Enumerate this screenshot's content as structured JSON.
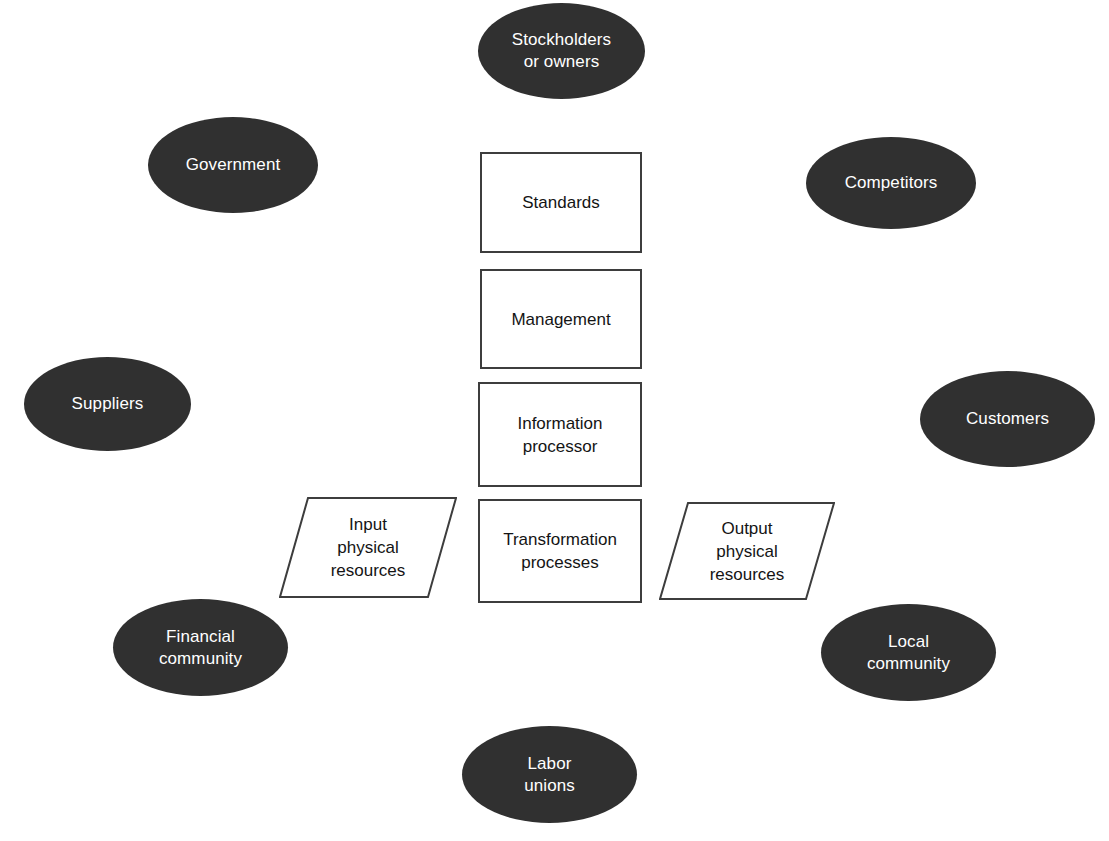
{
  "diagram": {
    "background_color": "#ffffff",
    "ellipse_fill_color": "#303030",
    "ellipse_text_color": "#ffffff",
    "box_border_color": "#3d3d3d",
    "box_fill_color": "#ffffff",
    "box_text_color": "#141414"
  },
  "environment_nodes": [
    {
      "id": "stockholders-or-owners",
      "label": "Stockholders\nor owners",
      "shape": "ellipse",
      "position": "top-center",
      "x": 478,
      "y": 3,
      "w": 167,
      "h": 96
    },
    {
      "id": "government",
      "label": "Government",
      "shape": "ellipse",
      "position": "top-left",
      "x": 148,
      "y": 117,
      "w": 170,
      "h": 96
    },
    {
      "id": "competitors",
      "label": "Competitors",
      "shape": "ellipse",
      "position": "top-right",
      "x": 806,
      "y": 137,
      "w": 170,
      "h": 92
    },
    {
      "id": "suppliers",
      "label": "Suppliers",
      "shape": "ellipse",
      "position": "middle-left",
      "x": 24,
      "y": 357,
      "w": 167,
      "h": 94
    },
    {
      "id": "customers",
      "label": "Customers",
      "shape": "ellipse",
      "position": "middle-right",
      "x": 920,
      "y": 371,
      "w": 175,
      "h": 96
    },
    {
      "id": "financial-community",
      "label": "Financial\ncommunity",
      "shape": "ellipse",
      "position": "bottom-left",
      "x": 113,
      "y": 599,
      "w": 175,
      "h": 97
    },
    {
      "id": "local-community",
      "label": "Local\ncommunity",
      "shape": "ellipse",
      "position": "bottom-right",
      "x": 821,
      "y": 604,
      "w": 175,
      "h": 97
    },
    {
      "id": "labor-unions",
      "label": "Labor\nunions",
      "shape": "ellipse",
      "position": "bottom-center",
      "x": 462,
      "y": 726,
      "w": 175,
      "h": 97
    }
  ],
  "system_nodes": [
    {
      "id": "standards",
      "label": "Standards",
      "shape": "rectangle",
      "x": 480,
      "y": 152,
      "w": 162,
      "h": 101
    },
    {
      "id": "management",
      "label": "Management",
      "shape": "rectangle",
      "x": 480,
      "y": 269,
      "w": 162,
      "h": 100
    },
    {
      "id": "information-processor",
      "label": "Information\nprocessor",
      "shape": "rectangle",
      "x": 478,
      "y": 382,
      "w": 164,
      "h": 105
    },
    {
      "id": "transformation-processes",
      "label": "Transformation\nprocesses",
      "shape": "rectangle",
      "x": 478,
      "y": 499,
      "w": 164,
      "h": 104
    }
  ],
  "flow_nodes": [
    {
      "id": "input-physical-resources",
      "label": "Input\nphysical\nresources",
      "shape": "parallelogram",
      "x": 279,
      "y": 497,
      "w": 178,
      "h": 101,
      "skew": 28
    },
    {
      "id": "output-physical-resources",
      "label": "Output\nphysical\nresources",
      "shape": "parallelogram",
      "x": 659,
      "y": 502,
      "w": 176,
      "h": 98,
      "skew": 28
    }
  ]
}
